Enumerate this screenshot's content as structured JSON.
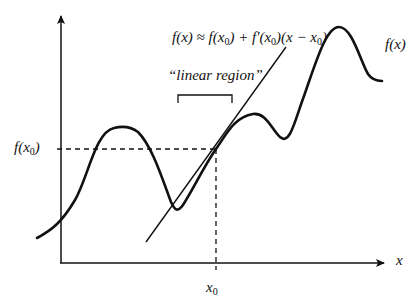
{
  "figure": {
    "formula": {
      "lhs": "f(x)",
      "approx": " ≈ ",
      "term1": "f(x",
      "term1_sub": "0",
      "term1_close": ")",
      "plus": " + ",
      "term2": "f'(x",
      "term2_sub": "0",
      "term2_close": ")",
      "paren_open": "(x − x",
      "paren_sub": "0",
      "paren_close": ")"
    },
    "linear_region_label": "“linear region”",
    "curve_label": "f(x)",
    "y_tick_label": {
      "main": "f(x",
      "sub": "0",
      "close": ")"
    },
    "x_axis_label": "x",
    "x_tick_label": {
      "main": "x",
      "sub": "0"
    },
    "colors": {
      "stroke": "#111111",
      "background": "#ffffff"
    }
  }
}
